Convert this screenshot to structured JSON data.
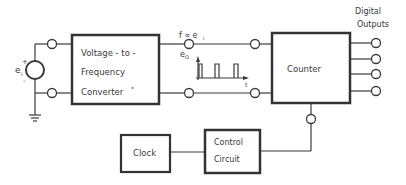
{
  "diagram": {
    "type": "block-diagram",
    "blocks": {
      "vf_converter": {
        "line1": "Voltage - to -",
        "line2": "Frequency",
        "line3": "Converter",
        "footnote_mark": "*"
      },
      "counter": {
        "label": "Counter"
      },
      "clock": {
        "label": "Clock"
      },
      "control_circuit": {
        "line1": "Control",
        "line2": "Circuit"
      }
    },
    "source": {
      "label": "e",
      "subscript": "i",
      "plus": "+",
      "minus": "-"
    },
    "signal": {
      "relation": "f ∝ e",
      "relation_sub": "i",
      "output_label": "e",
      "output_sub": "O",
      "time_axis": "t"
    },
    "outputs": {
      "line1": "Digital",
      "line2": "Outputs",
      "count": 4
    }
  }
}
